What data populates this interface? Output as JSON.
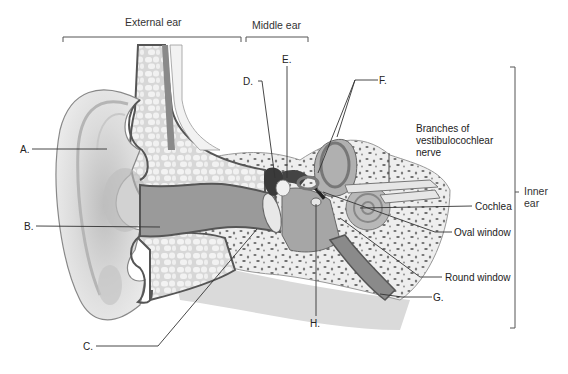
{
  "figure": {
    "regions": [
      {
        "id": "external",
        "label": "External ear"
      },
      {
        "id": "middle",
        "label": "Middle ear"
      },
      {
        "id": "inner",
        "label": "Inner\near",
        "label_line1": "Inner",
        "label_line2": "ear"
      }
    ],
    "letter_labels": [
      {
        "id": "A",
        "label": "A."
      },
      {
        "id": "B",
        "label": "B."
      },
      {
        "id": "C",
        "label": "C."
      },
      {
        "id": "D",
        "label": "D."
      },
      {
        "id": "E",
        "label": "E."
      },
      {
        "id": "F",
        "label": "F."
      },
      {
        "id": "G",
        "label": "G."
      },
      {
        "id": "H",
        "label": "H."
      }
    ],
    "named_labels": [
      {
        "id": "nerve",
        "line1": "Branches of",
        "line2": "vestibulocochlear",
        "line3": "nerve"
      },
      {
        "id": "cochlea",
        "label": "Cochlea"
      },
      {
        "id": "oval_window",
        "label": "Oval window"
      },
      {
        "id": "round_window",
        "label": "Round window"
      }
    ],
    "colors": {
      "background": "#ffffff",
      "skin_light": "#e4e4e4",
      "skin_mid": "#c9c9c9",
      "canal_dark": "#8f8f8f",
      "outline_dark": "#555555",
      "bone_light": "#ececec",
      "bone_spots": "#6e6e6e",
      "ossicle_dark": "#3a3a3a",
      "leader_line": "#333333"
    }
  }
}
